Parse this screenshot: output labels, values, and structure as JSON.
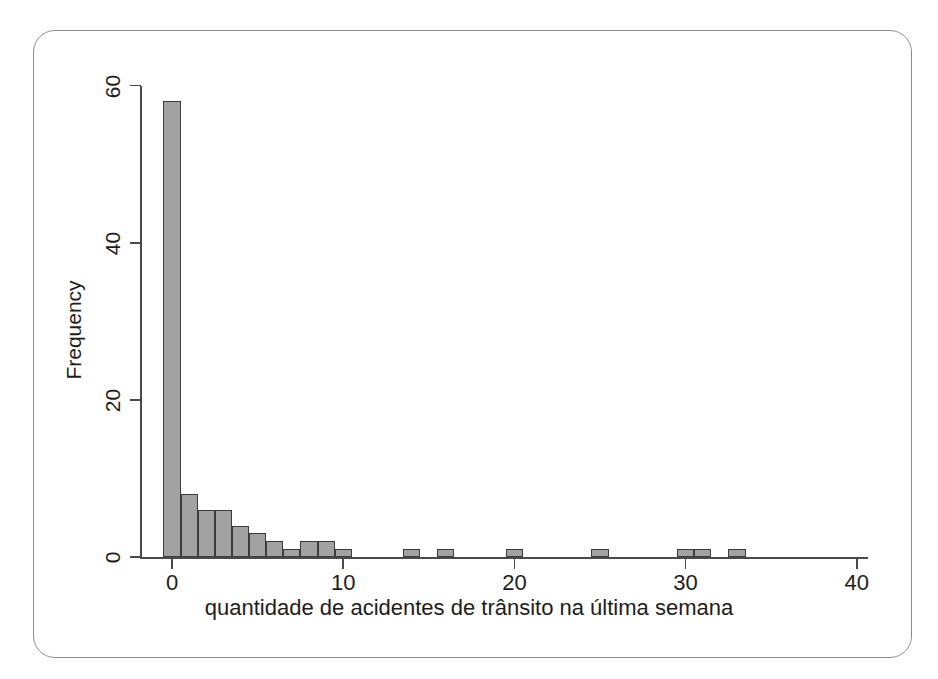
{
  "figure": {
    "frame_border_color": "#8e8e8e",
    "background_color": "#ffffff"
  },
  "chart_data": {
    "type": "bar",
    "subtype": "histogram",
    "title": "",
    "subtitle": "",
    "xlabel": "quantidade de acidentes de trânsito na última semana",
    "ylabel": "Frequency",
    "xlim": [
      -1.8,
      40.8
    ],
    "ylim": [
      0,
      60
    ],
    "grid": false,
    "legend": null,
    "bin_width": 1,
    "bar_fill_color": "#a2a2a2",
    "bar_edge_color": "#3b3b3b",
    "axis_color": "#4a4a4a",
    "xticks": [
      0,
      10,
      20,
      30,
      40
    ],
    "xtick_labels": [
      "0",
      "10",
      "20",
      "30",
      "40"
    ],
    "yticks": [
      0,
      20,
      40,
      60
    ],
    "ytick_labels": [
      "0",
      "20",
      "40",
      "60"
    ],
    "x": [
      0,
      1,
      2,
      3,
      4,
      5,
      6,
      7,
      8,
      9,
      10,
      14,
      16,
      20,
      25,
      30,
      31,
      33
    ],
    "values": [
      58,
      8,
      6,
      6,
      4,
      3,
      2,
      1,
      2,
      2,
      1,
      1,
      1,
      1,
      1,
      1,
      1,
      1
    ],
    "categories": [
      "0",
      "1",
      "2",
      "3",
      "4",
      "5",
      "6",
      "7",
      "8",
      "9",
      "10",
      "14",
      "16",
      "20",
      "25",
      "30",
      "31",
      "33"
    ],
    "series": [
      {
        "name": "Frequency",
        "values": [
          58,
          8,
          6,
          6,
          4,
          3,
          2,
          1,
          2,
          2,
          1,
          1,
          1,
          1,
          1,
          1,
          1,
          1
        ]
      }
    ]
  }
}
